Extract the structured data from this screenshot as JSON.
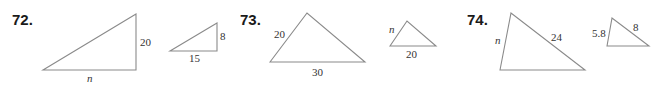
{
  "problems": [
    {
      "number": "72.",
      "large": {
        "labels": [
          "20",
          "n"
        ]
      },
      "small": {
        "labels": [
          "8",
          "15"
        ]
      }
    },
    {
      "number": "73.",
      "large": {
        "labels": [
          "20",
          "30"
        ]
      },
      "small": {
        "labels": [
          "n",
          "20"
        ]
      }
    },
    {
      "number": "74.",
      "large": {
        "labels": [
          "n",
          "24"
        ]
      },
      "small": {
        "labels": [
          "5.8",
          "8"
        ]
      }
    }
  ],
  "colors": {
    "stroke": "#8a8a8a",
    "text": "#333333",
    "number": "#1a1a1a"
  }
}
